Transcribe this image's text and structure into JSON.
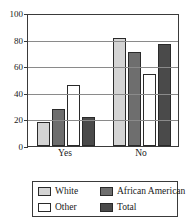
{
  "chart_data": {
    "type": "bar",
    "title": "",
    "subtitle": "",
    "xlabel": "",
    "ylabel": "",
    "categories": [
      "Yes",
      "No"
    ],
    "series": [
      {
        "name": "White",
        "values": [
          18,
          81
        ],
        "color": "#d4d4d4"
      },
      {
        "name": "African American",
        "values": [
          28,
          71
        ],
        "color": "#6e6e6e"
      },
      {
        "name": "Other",
        "values": [
          46,
          54
        ],
        "color": "#ffffff"
      },
      {
        "name": "Total",
        "values": [
          22,
          77
        ],
        "color": "#4a4a4a"
      }
    ],
    "ylim": [
      0,
      100
    ],
    "y_ticks": [
      0,
      20,
      40,
      60,
      80,
      100
    ],
    "y_tick_labels": [
      "0",
      "20",
      "40",
      "60",
      "80",
      "100"
    ],
    "grid": true,
    "grid_axis": "y",
    "legend_position": "bottom",
    "legend_entries": [
      {
        "label": "White",
        "color": "#d4d4d4"
      },
      {
        "label": "African American",
        "color": "#6e6e6e"
      },
      {
        "label": "Other",
        "color": "#ffffff"
      },
      {
        "label": "Total",
        "color": "#4a4a4a"
      }
    ]
  },
  "axis": {
    "y_tick_labels": [
      "0",
      "20",
      "40",
      "60",
      "80",
      "100"
    ],
    "x_tick_labels": [
      "Yes",
      "No"
    ]
  },
  "legend": {
    "items": [
      {
        "label": "White"
      },
      {
        "label": "African American"
      },
      {
        "label": "Other"
      },
      {
        "label": "Total"
      }
    ]
  },
  "colors": {
    "white_series": "#d4d4d4",
    "african_american_series": "#6e6e6e",
    "other_series": "#ffffff",
    "total_series": "#4a4a4a",
    "axis": "#3a3a3a",
    "gridline": "#8a8a8a",
    "background": "#ffffff"
  }
}
